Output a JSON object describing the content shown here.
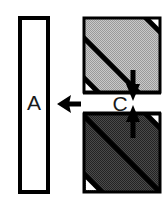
{
  "figure": {
    "type": "technical-diagram",
    "background_color": "#ffffff",
    "outline_color": "#000000"
  },
  "left_panel": {
    "label": "A",
    "label_color": "#1a1a1a",
    "fill_color": "#ffffff",
    "border_color": "#000000",
    "geometry": {
      "x": 20,
      "y": 18,
      "width": 28,
      "height": 174,
      "border_width": 4
    }
  },
  "pointer_arrow": {
    "name": "left-pointing-arrow",
    "direction": "left",
    "color": "#000000",
    "geometry": {
      "tip_x": 57,
      "tail_x": 81,
      "y": 104
    }
  },
  "right_panel": {
    "geometry": {
      "x": 82,
      "y": 16,
      "width": 80,
      "height": 178,
      "border_width": 3
    },
    "border_color": "#000000",
    "layers": [
      {
        "name": "upper-layer",
        "fill_color": "#b8b8b8",
        "hatch_color": "#000000",
        "geometry": {
          "x": 82,
          "y": 16,
          "width": 80,
          "height": 78
        }
      },
      {
        "name": "interlayer",
        "label": "C",
        "label_color": "#1a1a1a",
        "fill_color": "#ffffff",
        "geometry": {
          "x": 82,
          "y": 94,
          "width": 80,
          "height": 18
        }
      },
      {
        "name": "lower-layer",
        "fill_color": "#3a3a3a",
        "hatch_color": "#000000",
        "geometry": {
          "x": 82,
          "y": 112,
          "width": 80,
          "height": 82
        }
      }
    ],
    "measurement_arrows": {
      "name": "thickness-measure",
      "color": "#000000",
      "top_arrow": {
        "direction": "down",
        "x": 133,
        "from_y": 72,
        "to_y": 98
      },
      "bottom_arrow": {
        "direction": "up",
        "x": 133,
        "from_y": 136,
        "to_y": 108
      }
    }
  },
  "labels": {
    "a_label": "A",
    "c_label": "C"
  }
}
